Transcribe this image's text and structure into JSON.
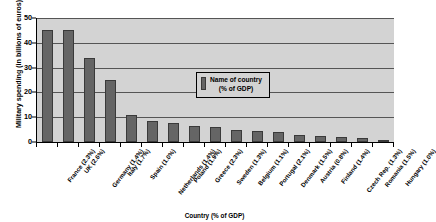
{
  "chart_data": {
    "type": "bar",
    "title": "",
    "xlabel": "Country (% of GDP)",
    "ylabel": "Military spending (in billions of euros)",
    "ylim": [
      0,
      50
    ],
    "yticks": [
      0,
      10,
      20,
      30,
      40,
      50
    ],
    "grid": true,
    "legend_position": "inside-upper-right",
    "legend": [
      {
        "label_line1": "Name of country",
        "label_line2": "(% of GDP)",
        "color": "#656565"
      }
    ],
    "categories": [
      "France (2.3%)",
      "UK (2.6%)",
      "Germany (1.4%)",
      "Italy (1.7%)",
      "Spain (1.0%)",
      "Netherlands (1.4%)",
      "Poland (1.9%)",
      "Greece (2.3%)",
      "Sweden (1.3%)",
      "Belgium (1.1%)",
      "Portugal (2.1%)",
      "Denmark (1.5%)",
      "Austria (0.8%)",
      "Finland (1.4%)",
      "Czech Rep. (1.3%)",
      "Romania (1.5%)",
      "Hungary (1.0%)"
    ],
    "values": [
      45,
      45,
      34,
      25,
      11,
      8.5,
      7.5,
      6.5,
      6,
      5,
      4.5,
      4,
      3,
      2.5,
      2,
      1.5,
      1
    ],
    "bar_color": "#656565",
    "bar_edge_color": "#3a3a3a",
    "plot_background": "#d3d3d3",
    "gridline_color": "#555555",
    "axis_color": "#000000"
  }
}
